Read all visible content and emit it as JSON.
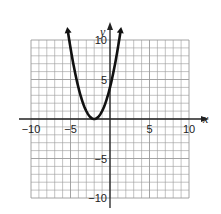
{
  "chart_data": {
    "type": "line",
    "title": "",
    "function": "y = (x + 2)^2",
    "xlabel": "x",
    "ylabel": "y",
    "xlim": [
      -10,
      10
    ],
    "ylim": [
      -10,
      10
    ],
    "grid": true,
    "x_ticks_labeled": [
      -10,
      -5,
      5,
      10
    ],
    "y_ticks_labeled": [
      10,
      5,
      -5,
      -10
    ],
    "tick_labels": {
      "x": [
        "−10",
        "−5",
        "5",
        "10"
      ],
      "y": [
        "10",
        "5",
        "−5",
        "−10"
      ]
    },
    "vertex": [
      -2,
      0
    ],
    "series": [
      {
        "name": "parabola",
        "x": [
          -5.3,
          -5,
          -4,
          -3,
          -2,
          -1,
          0,
          1,
          1.3
        ],
        "y": [
          10.9,
          9,
          4,
          1,
          0,
          1,
          4,
          9,
          10.9
        ],
        "arrows_at_ends": true
      }
    ],
    "colors": {
      "curve": "#111111",
      "grid": "#9a9a9a",
      "axis": "#222222"
    }
  }
}
